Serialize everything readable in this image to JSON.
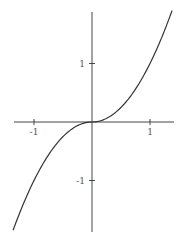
{
  "chart_data": {
    "type": "line",
    "title": "",
    "xlabel": "",
    "ylabel": "",
    "function": "y = x|x|",
    "xlim": [
      -1.36,
      1.38
    ],
    "ylim": [
      -1.87,
      1.88
    ],
    "grid": false,
    "legend": null,
    "x_ticks": [
      {
        "value": -1,
        "label": "-1"
      },
      {
        "value": 1,
        "label": "1"
      }
    ],
    "y_ticks": [
      {
        "value": 1,
        "label": "1"
      },
      {
        "value": -1,
        "label": "-1"
      }
    ],
    "series": [
      {
        "name": "curve",
        "x": [
          -1.36,
          -1.2,
          -1.0,
          -0.8,
          -0.6,
          -0.4,
          -0.2,
          0.0,
          0.2,
          0.4,
          0.6,
          0.8,
          1.0,
          1.2,
          1.38
        ],
        "y": [
          -1.85,
          -1.44,
          -1.0,
          -0.64,
          -0.36,
          -0.16,
          -0.04,
          0.0,
          0.04,
          0.16,
          0.36,
          0.64,
          1.0,
          1.44,
          1.9
        ]
      }
    ]
  },
  "style": {
    "axis_color": "#444444",
    "line_color": "#333333",
    "label_color": "#555555",
    "background": "#ffffff"
  },
  "layout": {
    "origin_px": [
      92,
      122
    ],
    "unit_px_x": 58,
    "unit_px_y": 58.5,
    "x_axis_px": [
      14,
      174
    ],
    "y_axis_px": [
      12,
      232
    ]
  }
}
